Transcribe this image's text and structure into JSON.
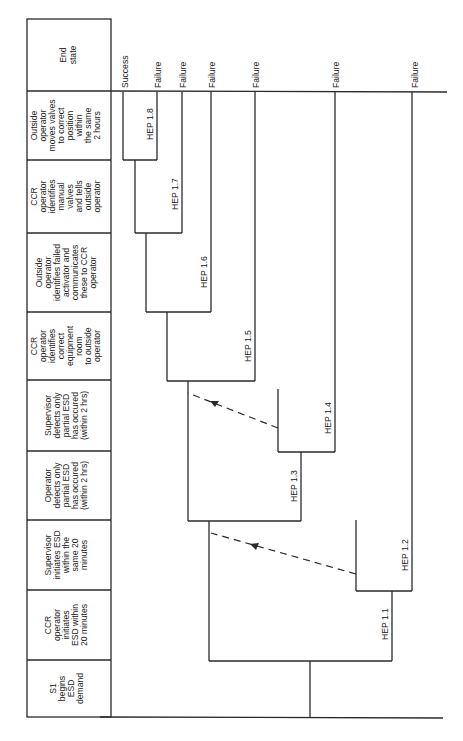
{
  "diagram": {
    "type": "event_tree",
    "orientation": "rotated_90_ccw",
    "headings": [
      {
        "id": "end_state",
        "lines": [
          "End",
          "state"
        ]
      },
      {
        "id": "outside_moves_valves",
        "lines": [
          "Outside",
          "operator",
          "moves valves",
          "to correct",
          "position",
          "within",
          "the same",
          "2 hours"
        ]
      },
      {
        "id": "ccr_identifies_manual_valves",
        "lines": [
          "CCR",
          "operator",
          "identifies",
          "manual",
          "valves",
          "and tells",
          "outside",
          "operator"
        ]
      },
      {
        "id": "outside_identifies_failed_activator",
        "lines": [
          "Outside",
          "operator",
          "identifies failed",
          "activator and",
          "communicates",
          "these to CCR",
          "operator"
        ]
      },
      {
        "id": "ccr_identifies_equipment_room",
        "lines": [
          "CCR",
          "operator",
          "identifies",
          "correct",
          "equipment",
          "room",
          "to outside",
          "operator"
        ]
      },
      {
        "id": "supervisor_detects_partial",
        "lines": [
          "Supervisor",
          "detects only",
          "partial ESD",
          "has occured",
          "(within 2 hrs)"
        ]
      },
      {
        "id": "operator_detects_partial",
        "lines": [
          "Operator",
          "detects only",
          "partial ESD",
          "has occured",
          "(within 2 hrs)"
        ]
      },
      {
        "id": "supervisor_initiates_esd",
        "lines": [
          "Supervisor",
          "initiates ESD",
          "within the",
          "same 20",
          "minutes"
        ]
      },
      {
        "id": "ccr_initiates_esd",
        "lines": [
          "CCR",
          "operator",
          "initiates",
          "ESD within",
          "20 minutes"
        ]
      },
      {
        "id": "s1_begins",
        "lines": [
          "S1",
          "begins",
          "ESD",
          "demand"
        ]
      }
    ],
    "end_states": [
      {
        "label": "Success"
      },
      {
        "label": "Failure"
      },
      {
        "label": "Failure"
      },
      {
        "label": "Failure"
      },
      {
        "label": "Failure"
      },
      {
        "label": "Failure"
      },
      {
        "label": "Failure"
      }
    ],
    "branches": [
      {
        "label": "HEP 1.1"
      },
      {
        "label": "HEP 1.2"
      },
      {
        "label": "HEP 1.3"
      },
      {
        "label": "HEP 1.4"
      },
      {
        "label": "HEP 1.5"
      },
      {
        "label": "HEP 1.6"
      },
      {
        "label": "HEP 1.7"
      },
      {
        "label": "HEP 1.8"
      }
    ],
    "recovery_arrows": [
      {
        "from": "HEP 1.2 branch",
        "to": "Operator detects only partial ESD path"
      },
      {
        "from": "HEP 1.4 branch",
        "to": "CCR operator identifies correct equipment room path"
      }
    ]
  }
}
